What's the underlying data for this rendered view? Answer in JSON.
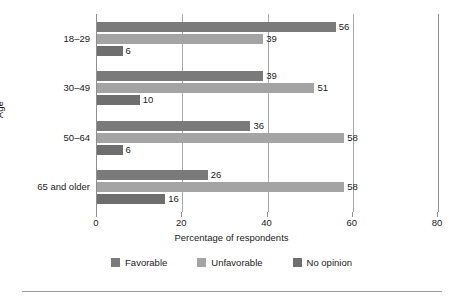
{
  "chart_data": {
    "type": "bar",
    "orientation": "horizontal",
    "grouped": true,
    "title": "",
    "xlabel": "Percentage of respondents",
    "ylabel": "Age",
    "xlim": [
      0,
      80
    ],
    "xticks": [
      0,
      20,
      40,
      60,
      80
    ],
    "gridlines": [
      20,
      40,
      60
    ],
    "grid": true,
    "legend_position": "bottom",
    "categories": [
      "18–29",
      "30–49",
      "50–64",
      "65 and older"
    ],
    "series": [
      {
        "name": "Favorable",
        "color": "#7a7a7a",
        "values": [
          56,
          39,
          36,
          26
        ]
      },
      {
        "name": "Unfavorable",
        "color": "#a4a4a4",
        "values": [
          39,
          51,
          58,
          58
        ]
      },
      {
        "name": "No opinion",
        "color": "#6e6e6e",
        "values": [
          6,
          10,
          6,
          16
        ]
      }
    ],
    "data_labels": {
      "18–29": {
        "Favorable": "56",
        "Unfavorable": "39",
        "No opinion": "6"
      },
      "30–49": {
        "Favorable": "39",
        "Unfavorable": "51",
        "No opinion": "10"
      },
      "50–64": {
        "Favorable": "36",
        "Unfavorable": "58",
        "No opinion": "6"
      },
      "65 and older": {
        "Favorable": "26",
        "Unfavorable": "58",
        "No opinion": "16"
      }
    },
    "tick_labels": [
      "0",
      "20",
      "40",
      "60",
      "80"
    ]
  },
  "axes": {
    "x_title": "Percentage of respondents",
    "y_title": "Age"
  },
  "legend": {
    "items": [
      {
        "label": "Favorable"
      },
      {
        "label": "Unfavorable"
      },
      {
        "label": "No opinion"
      }
    ]
  },
  "colors": {
    "favorable": "#7a7a7a",
    "unfavorable": "#a4a4a4",
    "no_opinion": "#6e6e6e",
    "axis": "#8e8e8e",
    "grid": "#a8a8a8",
    "text": "#1a1a1a",
    "rule": "#9a9a9a",
    "background": "#ffffff"
  }
}
